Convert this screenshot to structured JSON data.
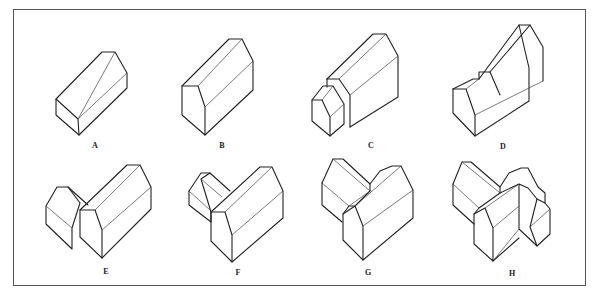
{
  "figure": {
    "panels": [
      {
        "id": "A",
        "label": "A",
        "description": "simple gabled block"
      },
      {
        "id": "B",
        "label": "B",
        "description": "taller gabled block"
      },
      {
        "id": "C",
        "label": "C",
        "description": "gabled block with lower front extension"
      },
      {
        "id": "D",
        "label": "D",
        "description": "gabled block with stepped front ridge"
      },
      {
        "id": "E",
        "label": "E",
        "description": "two gabled blocks meeting side by side"
      },
      {
        "id": "F",
        "label": "F",
        "description": "L-shaped gabled blocks"
      },
      {
        "id": "G",
        "label": "G",
        "description": "L-shaped blocks with valley junction"
      },
      {
        "id": "H",
        "label": "H",
        "description": "compound multi-wing gabled building"
      }
    ]
  },
  "colors": {
    "line": "#222222",
    "frame": "#555555",
    "background": "#ffffff"
  }
}
